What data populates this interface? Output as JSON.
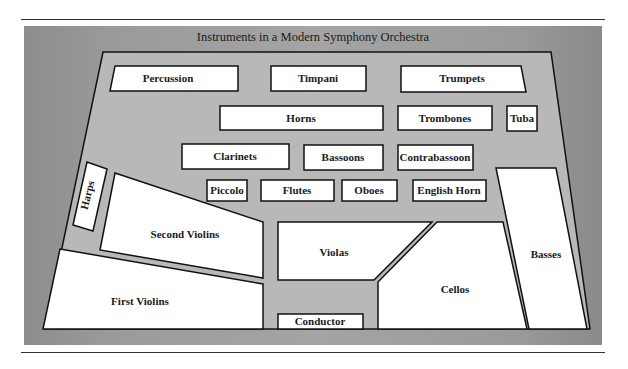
{
  "title": "Instruments in a Modern Symphony Orchestra",
  "colors": {
    "panel": "#9c9c9c",
    "stage": "#b5b5b5",
    "section_fill": "#ffffff",
    "outline": "#111111"
  },
  "sections": {
    "percussion": "Percussion",
    "timpani": "Timpani",
    "trumpets": "Trumpets",
    "horns": "Horns",
    "trombones": "Trombones",
    "tuba": "Tuba",
    "clarinets": "Clarinets",
    "bassoons": "Bassoons",
    "contrabassoon": "Contrabassoon",
    "harps": "Harps",
    "piccolo": "Piccolo",
    "flutes": "Flutes",
    "oboes": "Oboes",
    "english_horn": "English Horn",
    "second_violins": "Second Violins",
    "violas": "Violas",
    "basses": "Basses",
    "first_violins": "First Violins",
    "cellos": "Cellos",
    "conductor": "Conductor"
  }
}
